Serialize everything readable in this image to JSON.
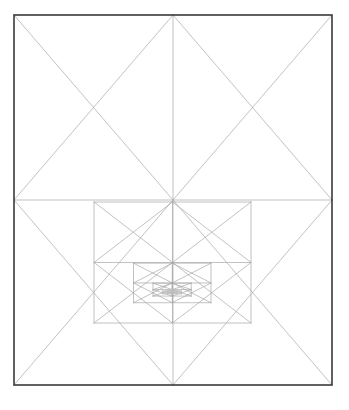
{
  "document": {
    "title": "Nested Squares Recursive Geometric Figure",
    "background_color": "#ffffff",
    "width": 349,
    "height": 410
  },
  "figure": {
    "name": "recursive-nested-squares-and-diamonds",
    "description": "A rectangular frame containing a recursive pattern of inscribed diamonds and squares converging toward an off-center point.",
    "frame": {
      "x": 14,
      "y": 15,
      "width": 318,
      "height": 370,
      "stroke_color": "#3a3a3a",
      "stroke_width": 1.6,
      "fill": "none"
    },
    "line_style": {
      "stroke_color": "#a8a8a8",
      "stroke_color_faint": "#bdbdbd",
      "stroke_width": 0.7,
      "fill": "none",
      "linecap": "round"
    },
    "recursion": {
      "levels": 9,
      "scale_factor": 0.5,
      "convergence_point": {
        "x": 173,
        "y": 263
      },
      "first_square": {
        "left": 14,
        "top": 15,
        "right": 332,
        "bottom": 385,
        "mid_x": 173,
        "mid_y": 142
      },
      "second_square": {
        "left": 94,
        "top": 202,
        "right": 251,
        "bottom": 323,
        "mid_x": 172,
        "mid_y": 263
      },
      "third_square": {
        "left": 133,
        "top": 232,
        "right": 212,
        "bottom": 293
      }
    },
    "elements": [
      {
        "label": "outer-frame",
        "type": "rectangle"
      },
      {
        "label": "level-1-diamond",
        "type": "diamond"
      },
      {
        "label": "level-1-diagonals",
        "type": "diagonal-pair"
      },
      {
        "label": "level-1-midlines",
        "type": "cross-lines"
      },
      {
        "label": "level-2-square",
        "type": "rectangle"
      },
      {
        "label": "level-2-diamond",
        "type": "diamond"
      },
      {
        "label": "level-3-square",
        "type": "rectangle"
      },
      {
        "label": "level-3-diamond",
        "type": "diamond"
      },
      {
        "label": "inner-recursion-cluster",
        "type": "nested-group"
      }
    ]
  },
  "chart_data": {
    "type": "diagram",
    "geometry": "Each rectangle has an inscribed diamond joining the midpoints of its sides; the diamond's bounding box becomes the next rectangle, with the upper half collapsing so the pattern drifts downward toward a fixed point.",
    "outer_rectangle": [
      14,
      15,
      332,
      385
    ],
    "levels": 9
  }
}
